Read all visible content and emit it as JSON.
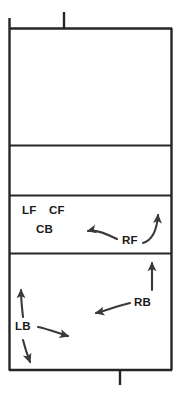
{
  "diagram": {
    "line_color": "#262626",
    "arrow_color": "#3a3a3a",
    "text_color": "#1a1a1a",
    "background": "#ffffff",
    "court": {
      "left": 9,
      "right": 172,
      "top": 28,
      "bottom": 370,
      "horizontal_lines": [
        145,
        195,
        253
      ],
      "post_top": {
        "x": 64,
        "y_top": 12,
        "y_bottom": 28
      },
      "post_bottom": {
        "x": 120,
        "y_top": 370,
        "y_bottom": 385
      },
      "left_edge_extends_top": 18,
      "zones": [
        {
          "name": "back-zone",
          "y_top": 28,
          "y_bottom": 145
        },
        {
          "name": "mid-zone",
          "y_top": 145,
          "y_bottom": 195
        },
        {
          "name": "front-row-zone",
          "y_top": 195,
          "y_bottom": 253
        },
        {
          "name": "back-row-zone",
          "y_top": 253,
          "y_bottom": 370
        }
      ]
    },
    "labels": [
      {
        "id": "lf",
        "text": "LF",
        "x": 22,
        "y": 214
      },
      {
        "id": "cf",
        "text": "CF",
        "x": 49,
        "y": 214
      },
      {
        "id": "cb",
        "text": "CB",
        "x": 36,
        "y": 233
      },
      {
        "id": "rf",
        "text": "RF",
        "x": 122,
        "y": 244
      },
      {
        "id": "rb",
        "text": "RB",
        "x": 134,
        "y": 306
      },
      {
        "id": "lb",
        "text": "LB",
        "x": 15,
        "y": 330
      }
    ],
    "arrows": [
      {
        "id": "rf-left-arrow",
        "from": "RF",
        "direction": "left"
      },
      {
        "id": "rf-up-right-arrow",
        "from": "RF",
        "direction": "up-right"
      },
      {
        "id": "rb-up-arrow",
        "from": "RB",
        "direction": "up"
      },
      {
        "id": "rb-left-arrow",
        "from": "RB",
        "direction": "left"
      },
      {
        "id": "lb-up-arrow",
        "from": "LB",
        "direction": "up"
      },
      {
        "id": "lb-right-arrow",
        "from": "LB",
        "direction": "right"
      },
      {
        "id": "lb-down-arrow",
        "from": "LB",
        "direction": "down"
      }
    ]
  }
}
